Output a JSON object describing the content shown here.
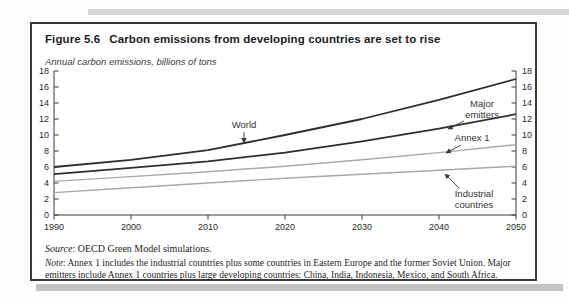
{
  "figure": {
    "label": "Figure 5.6",
    "title": "Carbon emissions from developing countries are set to rise",
    "subtitle": "Annual carbon emissions, billions of tons"
  },
  "chart_data": {
    "type": "line",
    "title": "Carbon emissions from developing countries are set to rise",
    "ylabel": "Annual carbon emissions, billions of tons",
    "xlabel": "",
    "x": [
      1990,
      2000,
      2010,
      2020,
      2030,
      2040,
      2050
    ],
    "ylim": [
      0,
      18
    ],
    "ytick_step": 2,
    "grid": false,
    "legend_position": "inline-annotations",
    "axis_color": "#3a3a3a",
    "series": [
      {
        "name": "World",
        "values": [
          6.0,
          6.9,
          8.1,
          10.0,
          12.0,
          14.4,
          17.0
        ],
        "color": "#2e2e2e",
        "width": 1.8
      },
      {
        "name": "Major emitters",
        "values": [
          5.1,
          5.9,
          6.7,
          7.8,
          9.2,
          10.8,
          12.6
        ],
        "color": "#2e2e2e",
        "width": 1.8
      },
      {
        "name": "Annex 1",
        "values": [
          4.2,
          4.8,
          5.4,
          6.1,
          6.9,
          7.8,
          8.8
        ],
        "color": "#a8a8a8",
        "width": 1.4
      },
      {
        "name": "Industrial countries",
        "values": [
          2.8,
          3.4,
          4.0,
          4.6,
          5.1,
          5.6,
          6.1
        ],
        "color": "#a8a8a8",
        "width": 1.4
      }
    ],
    "annotations": [
      {
        "lines": [
          "World"
        ]
      },
      {
        "lines": [
          "Major",
          "emitters"
        ]
      },
      {
        "lines": [
          "Annex 1"
        ]
      },
      {
        "lines": [
          "Industrial",
          "countries"
        ]
      }
    ]
  },
  "source": {
    "label": "Source",
    "text": ": OECD Green Model simulations."
  },
  "note": {
    "label": "Note",
    "text": ": Annex 1 includes the industrial countries plus some countries in Eastern Europe and the former Soviet Union. Major emitters include Annex 1 countries plus large developing countries: China, India, Indonesia, Mexico, and South Africa."
  }
}
